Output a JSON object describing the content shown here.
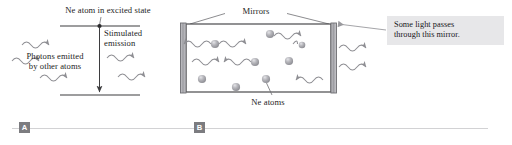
{
  "figure": {
    "background_color": "#ffffff"
  },
  "panel_a": {
    "badge": "A",
    "labels": {
      "ne_excited": "Ne atom in excited state",
      "photons_emitted": "Photons emitted\nby other atoms",
      "stimulated_emission": "Stimulated\nemission"
    },
    "energy_levels": {
      "upper_level_y": 26,
      "lower_level_y": 95
    },
    "photon_waves_in": 3,
    "photon_waves_out": 2,
    "colors": {
      "line": "#3d3d3f",
      "wave": "#8e8e93",
      "text": "#242424"
    }
  },
  "panel_b": {
    "badge": "B",
    "labels": {
      "mirrors": "Mirrors",
      "ne_atoms": "Ne atoms"
    },
    "callout": {
      "text": "Some light passes\nthrough this mirror.",
      "background_color": "#e7e7e9",
      "text_color": "#16161a"
    },
    "cavity": {
      "left_mirror_x": 183,
      "right_mirror_x": 331,
      "top_y": 24,
      "bottom_y": 92,
      "mirror_color": "#9a9a9e",
      "wall_color": "#4a4a4c"
    },
    "atom_count": 10,
    "internal_wave_count": 7,
    "escaping_wave_count": 2,
    "colors": {
      "atom_fill": "#a8a8ac",
      "atom_highlight": "#d9d9dd",
      "wave": "#8e8e93",
      "leader": "#6e6e72"
    }
  },
  "badges": {
    "a": "A",
    "b": "B",
    "background_color": "#7c7c80",
    "text_color": "#ffffff"
  },
  "rules": {
    "color": "#d2d2d4"
  }
}
